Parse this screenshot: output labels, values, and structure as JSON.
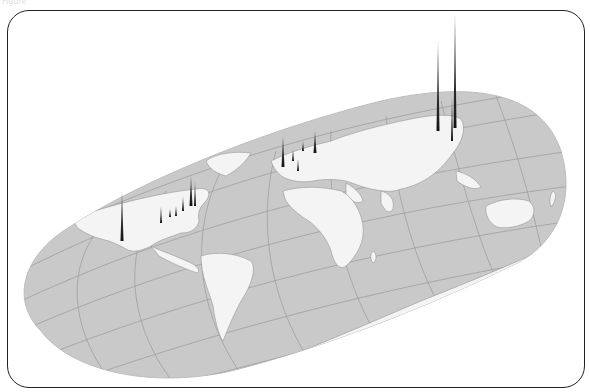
{
  "caption": "Figure",
  "map": {
    "projection": "oblique tilted world map (Hammer-like)",
    "ocean_color": "#c9c9c9",
    "land_color": "#f4f4f4",
    "graticule_color": "#9a9a9a",
    "spike_color": "#222222",
    "spikes": [
      {
        "region": "US west coast",
        "x": 121,
        "base": 240,
        "top": 190
      },
      {
        "region": "US midwest",
        "x": 160,
        "base": 222,
        "top": 205
      },
      {
        "region": "US northeast 1",
        "x": 190,
        "base": 205,
        "top": 175
      },
      {
        "region": "US northeast 2",
        "x": 194,
        "base": 205,
        "top": 180
      },
      {
        "region": "US east",
        "x": 182,
        "base": 210,
        "top": 195
      },
      {
        "region": "Europe UK",
        "x": 282,
        "base": 166,
        "top": 135
      },
      {
        "region": "Europe central",
        "x": 292,
        "base": 160,
        "top": 148
      },
      {
        "region": "Europe north",
        "x": 302,
        "base": 150,
        "top": 140
      },
      {
        "region": "Europe east",
        "x": 314,
        "base": 152,
        "top": 130
      },
      {
        "region": "Japan 1",
        "x": 437,
        "base": 130,
        "top": 40
      },
      {
        "region": "Japan 2",
        "x": 454,
        "base": 127,
        "top": 12
      },
      {
        "region": "Japan 3",
        "x": 451,
        "base": 140,
        "top": 95
      }
    ]
  }
}
